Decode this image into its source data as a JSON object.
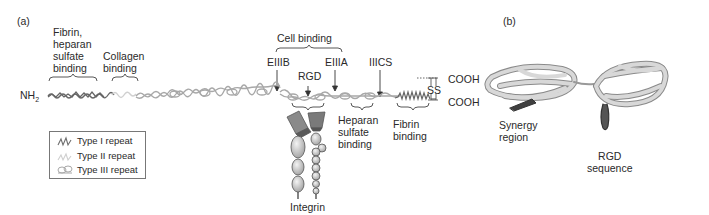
{
  "panel_a": {
    "label": "(a)",
    "n_terminus": "NH",
    "n_terminus_sub": "2",
    "c_terminus_top": "COOH",
    "c_terminus_bottom": "COOH",
    "disulfide": "SS",
    "regions_above": [
      {
        "id": "fibrin-heparan",
        "label": "Fibrin,\nheparan\nsulfate\nbinding"
      },
      {
        "id": "collagen",
        "label": "Collagen\nbinding"
      },
      {
        "id": "cell-binding",
        "label": "Cell binding"
      }
    ],
    "markers": [
      {
        "id": "eiiib",
        "label": "EIIIB"
      },
      {
        "id": "rgd",
        "label": "RGD"
      },
      {
        "id": "eiiia",
        "label": "EIIIA"
      },
      {
        "id": "iiics",
        "label": "IIICS"
      }
    ],
    "regions_below": [
      {
        "id": "heparan",
        "label": "Heparan\nsulfate\nbinding"
      },
      {
        "id": "fibrin",
        "label": "Fibrin\nbinding"
      }
    ],
    "integrin_label": "Integrin",
    "legend": [
      {
        "icon": "type-i-repeat-icon",
        "label": "Type I repeat",
        "color": "#6e6e6e"
      },
      {
        "icon": "type-ii-repeat-icon",
        "label": "Type II repeat",
        "color": "#d2d2d2"
      },
      {
        "icon": "type-iii-repeat-icon",
        "label": "Type III repeat",
        "color": "#a8a8a8"
      }
    ]
  },
  "panel_b": {
    "label": "(b)",
    "synergy_label": "Synergy\nregion",
    "rgd_label": "RGD\nsequence"
  },
  "colors": {
    "type_i": "#6e6e6e",
    "type_ii": "#d4d4d4",
    "type_iii": "#a9a9a9",
    "ribbon": "#bdbdbd",
    "ribbon_dark": "#555555",
    "text": "#2a2a2a"
  }
}
